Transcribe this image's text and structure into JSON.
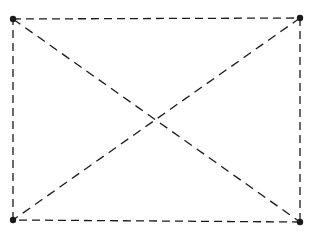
{
  "diagram": {
    "type": "rectangle-with-diagonals",
    "stroke_color": "#1a1a1a",
    "background": "#ffffff",
    "line_style": "dashed",
    "vertices": [
      {
        "id": "top-left",
        "x": 13,
        "y": 19
      },
      {
        "id": "top-right",
        "x": 300,
        "y": 18
      },
      {
        "id": "bottom-right",
        "x": 300,
        "y": 222
      },
      {
        "id": "bottom-left",
        "x": 13,
        "y": 220
      }
    ],
    "edges": [
      {
        "id": "top-edge",
        "from": "top-left",
        "to": "top-right"
      },
      {
        "id": "right-edge",
        "from": "top-right",
        "to": "bottom-right"
      },
      {
        "id": "bottom-edge",
        "from": "bottom-right",
        "to": "bottom-left"
      },
      {
        "id": "left-edge",
        "from": "bottom-left",
        "to": "top-left"
      },
      {
        "id": "diagonal-main",
        "from": "top-left",
        "to": "bottom-right"
      },
      {
        "id": "diagonal-anti",
        "from": "top-right",
        "to": "bottom-left"
      }
    ],
    "vertex_radius": 3.2
  }
}
